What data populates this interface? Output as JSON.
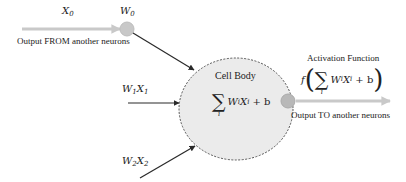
{
  "diagram": {
    "inputs": [
      {
        "id": "x0",
        "label": "X",
        "sub": "0",
        "weight_label": "W",
        "weight_sub": "0",
        "caption": "Output FROM another neurons"
      },
      {
        "id": "w1x1",
        "label": "W",
        "sub": "1",
        "label2": "X",
        "sub2": "1"
      },
      {
        "id": "w2x2",
        "label": "W",
        "sub": "2",
        "label2": "X",
        "sub2": "2"
      }
    ],
    "cell_body": {
      "title": "Cell Body",
      "formula": {
        "sigma": "∑",
        "index": "i",
        "w": "W",
        "w_sub": "i",
        "x": "X",
        "x_sub": "i",
        "tail": "+ b"
      }
    },
    "activation": {
      "title": "Activation Function",
      "formula": {
        "f": "f",
        "open": "(",
        "sigma": "∑",
        "index": "i",
        "w": "W",
        "w_sub": "i",
        "x": "X",
        "x_sub": "i",
        "tail": "+ b",
        "close": ")"
      }
    },
    "output_caption": "Output TO another neurons",
    "colors": {
      "node_fill": "#c8c8c8",
      "cell_fill": "#ebebeb",
      "arrow_gray": "#c9c9c9",
      "arrow_dark": "#2a2a2a",
      "outline": "#555555"
    }
  }
}
